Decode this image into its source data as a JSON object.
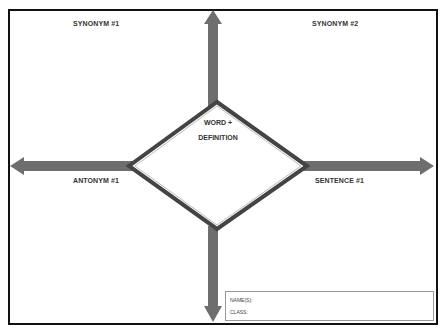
{
  "worksheet": {
    "quadrants": {
      "top_left": "SYNONYM #1",
      "top_right": "SYNONYM #2",
      "bottom_left": "ANTONYM #1",
      "bottom_right": "SENTENCE #1"
    },
    "center": {
      "line1": "WORD +",
      "line2": "DEFINITION"
    },
    "info_box": {
      "name_label": "NAME(S):",
      "class_label": "CLASS:"
    },
    "colors": {
      "arrow": "#6e6e6e",
      "border": "#111111",
      "diamond_outline": "#444444"
    }
  }
}
